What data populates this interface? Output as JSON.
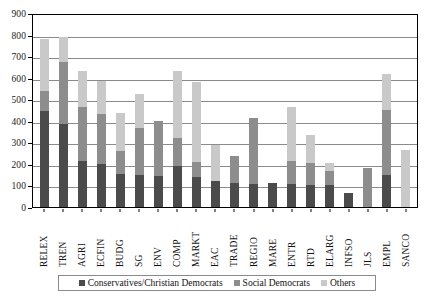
{
  "chart_data": {
    "type": "bar",
    "title": "",
    "subtitle": "",
    "xlabel": "",
    "ylabel": "",
    "ylim": [
      0,
      900
    ],
    "ytick_step": 100,
    "yticks": [
      0,
      100,
      200,
      300,
      400,
      500,
      600,
      700,
      800,
      900
    ],
    "grid": true,
    "stacked": true,
    "legend_position": "bottom",
    "categories": [
      "RELEX",
      "TREN",
      "AGRI",
      "ECFIN",
      "BUDG",
      "SG",
      "ENV",
      "COMP",
      "MARKT",
      "EAC",
      "TRADE",
      "REGIO",
      "MARE",
      "ENTR",
      "RTD",
      "ELARG",
      "INFSO",
      "JLS",
      "EMPL",
      "SANCO"
    ],
    "series": [
      {
        "name": "Conservatives/Christian Democrats",
        "color": "#4b4b4b",
        "values": [
          445,
          385,
          215,
          200,
          155,
          150,
          145,
          190,
          140,
          120,
          110,
          105,
          110,
          105,
          100,
          100,
          65,
          0,
          150,
          0
        ]
      },
      {
        "name": "Social Democrats",
        "color": "#8d8d8d",
        "values": [
          95,
          290,
          250,
          230,
          105,
          215,
          255,
          130,
          70,
          0,
          125,
          310,
          0,
          110,
          105,
          65,
          0,
          180,
          300,
          0
        ]
      },
      {
        "name": "Others",
        "color": "#c9c9c9",
        "values": [
          240,
          115,
          165,
          155,
          175,
          160,
          0,
          310,
          370,
          170,
          0,
          0,
          0,
          250,
          130,
          40,
          0,
          0,
          165,
          265
        ]
      }
    ],
    "totals": [
      780,
      790,
      630,
      585,
      435,
      525,
      400,
      630,
      580,
      290,
      235,
      415,
      110,
      465,
      335,
      205,
      65,
      180,
      615,
      265
    ]
  },
  "legend": {
    "items": [
      {
        "label": "Conservatives/Christian Democrats",
        "color": "#4b4b4b"
      },
      {
        "label": "Social Democrats",
        "color": "#8d8d8d"
      },
      {
        "label": "Others",
        "color": "#c9c9c9"
      }
    ]
  }
}
